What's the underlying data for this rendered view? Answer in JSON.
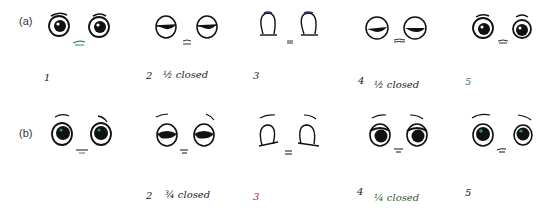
{
  "rows": [
    {
      "label": "(a)",
      "frames": [
        {
          "number": "1",
          "caption": ""
        },
        {
          "number": "2",
          "caption": "½ closed"
        },
        {
          "number": "3",
          "caption": ""
        },
        {
          "number": "4",
          "caption": "½ closed"
        },
        {
          "number": "5",
          "caption": ""
        }
      ]
    },
    {
      "label": "(b)",
      "frames": [
        {
          "number": "",
          "caption": ""
        },
        {
          "number": "2",
          "caption": "¾ closed"
        },
        {
          "number": "3",
          "caption": ""
        },
        {
          "number": "4",
          "caption": "¼ closed"
        },
        {
          "number": "5",
          "caption": ""
        }
      ]
    }
  ],
  "colors": {
    "ink": "#111111",
    "mouth_green": "#3a8a55",
    "lid_blue": "#33337a",
    "number_red": "#8a2a2a"
  }
}
